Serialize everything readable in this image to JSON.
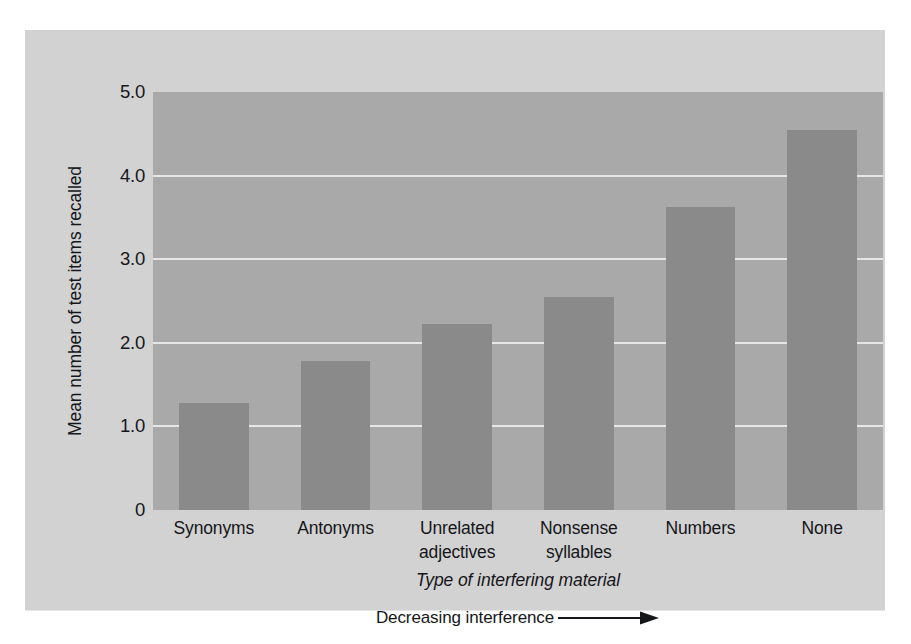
{
  "chart_data": {
    "type": "bar",
    "title": "",
    "subtitle": "",
    "xlabel": "Type of interfering material",
    "ylabel": "Mean number of test items recalled",
    "categories": [
      "Synonyms",
      "Antonyms",
      "Unrelated adjectives",
      "Nonsense syllables",
      "Numbers",
      "None"
    ],
    "category_lines": [
      [
        "Synonyms",
        ""
      ],
      [
        "Antonyms",
        ""
      ],
      [
        "Unrelated",
        "adjectives"
      ],
      [
        "Nonsense",
        "syllables"
      ],
      [
        "Numbers",
        ""
      ],
      [
        "None",
        ""
      ]
    ],
    "values": [
      1.28,
      1.78,
      2.23,
      2.55,
      3.62,
      4.55
    ],
    "ylim": [
      0,
      5.0
    ],
    "y_ticks": [
      0,
      1.0,
      2.0,
      3.0,
      4.0,
      5.0
    ],
    "y_tick_labels": [
      "0",
      "1.0",
      "2.0",
      "3.0",
      "4.0",
      "5.0"
    ],
    "grid": true,
    "grid_axis": "y",
    "legend": false,
    "legend_position": "none",
    "annotation": "Decreasing interference",
    "annotation_arrow": "right-arrow"
  },
  "colors": {
    "page_background": "#ffffff",
    "card_background": "#d2d2d2",
    "plot_background": "#a9a9a9",
    "bar_fill": "#8a8a8a",
    "gridline": "#e6e6e6",
    "text": "#15161a"
  },
  "axes": {
    "y_title": "Mean number of test items recalled",
    "x_title": "Type of interfering material"
  },
  "annotation": {
    "label": "Decreasing interference",
    "arrow_glyph": "→"
  }
}
